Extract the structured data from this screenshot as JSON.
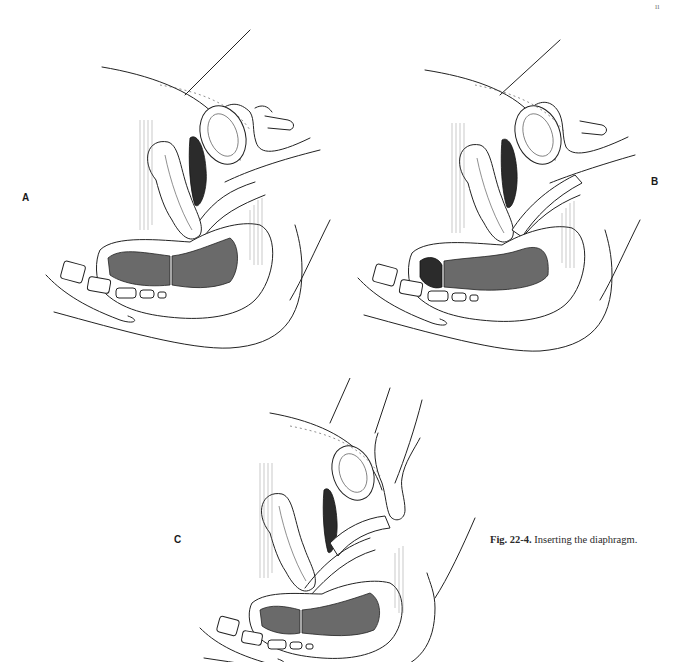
{
  "figure": {
    "number": "Fig. 22-4.",
    "title": "Inserting the diaphragm.",
    "corner_mark": "ıı",
    "panels": [
      {
        "id": "A",
        "label": "A",
        "description": "Sagittal section; hand holding folded diaphragm at vaginal introitus"
      },
      {
        "id": "B",
        "label": "B",
        "description": "Sagittal section; diaphragm being advanced along posterior vaginal wall"
      },
      {
        "id": "C",
        "label": "C",
        "description": "Sagittal section; finger tucking anterior rim behind pubic bone"
      }
    ]
  },
  "colors": {
    "ink": "#222222",
    "background": "#ffffff",
    "caption": "#2a2a2a"
  }
}
